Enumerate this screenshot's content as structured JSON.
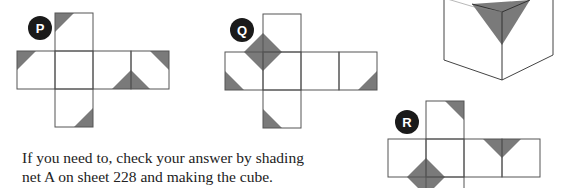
{
  "nets": [
    {
      "label": "P"
    },
    {
      "label": "Q"
    },
    {
      "label": "R"
    }
  ],
  "figure": {
    "shade_color": "#7a7a7a",
    "line_color": "#555555"
  },
  "caption": {
    "line1": "If you need to, check your answer by shading",
    "line2": "net A on sheet 228 and making the cube."
  }
}
